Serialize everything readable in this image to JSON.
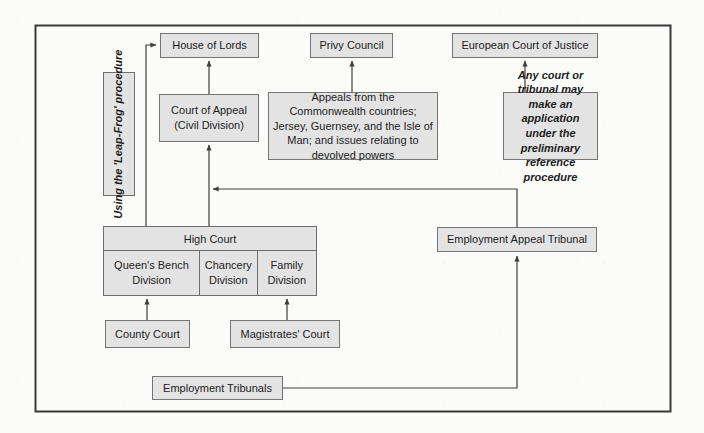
{
  "diagram": {
    "frame": {
      "x": 35,
      "y": 25,
      "width": 636,
      "height": 387,
      "stroke": "#3a3a3a"
    },
    "colors": {
      "box_fill": "#e3e3e3",
      "box_stroke": "#6e6e6e",
      "line": "#3f3f3f",
      "text": "#1d1d1d",
      "page_background": "#fbfbfa"
    },
    "nodes": [
      {
        "id": "house-of-lords",
        "label": "House of Lords",
        "x": 160,
        "y": 33,
        "w": 99,
        "h": 25,
        "style": "plain"
      },
      {
        "id": "privy-council",
        "label": "Privy Council",
        "x": 310,
        "y": 33,
        "w": 83,
        "h": 25,
        "style": "plain"
      },
      {
        "id": "european-court-of-justice",
        "label": "European Court of Justice",
        "x": 452,
        "y": 33,
        "w": 146,
        "h": 25,
        "style": "plain"
      },
      {
        "id": "court-of-appeal",
        "label": "Court of Appeal\n(Civil Division)",
        "x": 159,
        "y": 94,
        "w": 100,
        "h": 48,
        "style": "plain"
      },
      {
        "id": "privy-council-jurisdiction",
        "label": "Appeals from the Commonwealth countries; Jersey, Guernsey, and the Isle of Man; and issues relating to devolved powers",
        "x": 268,
        "y": 92,
        "w": 170,
        "h": 68,
        "style": "plain"
      },
      {
        "id": "ecj-reference-note",
        "label": "Any court or tribunal may make an application under the preliminary reference procedure",
        "x": 503,
        "y": 92,
        "w": 95,
        "h": 68,
        "style": "italic"
      },
      {
        "id": "employment-appeal-tribunal",
        "label": "Employment Appeal Tribunal",
        "x": 437,
        "y": 227,
        "w": 160,
        "h": 25,
        "style": "plain"
      },
      {
        "id": "county-court",
        "label": "County Court",
        "x": 105,
        "y": 320,
        "w": 85,
        "h": 28,
        "style": "plain"
      },
      {
        "id": "magistrates-court",
        "label": "Magistrates' Court",
        "x": 230,
        "y": 320,
        "w": 110,
        "h": 28,
        "style": "plain"
      },
      {
        "id": "employment-tribunals",
        "label": "Employment Tribunals",
        "x": 152,
        "y": 376,
        "w": 131,
        "h": 24,
        "style": "plain"
      }
    ],
    "high_court": {
      "id": "high-court",
      "header_label": "High Court",
      "x": 103,
      "y": 226,
      "w": 214,
      "h": 70,
      "header_h": 24,
      "divisions": [
        {
          "id": "queens-bench-division",
          "label": "Queen's Bench Division",
          "width_px": 97
        },
        {
          "id": "chancery-division",
          "label": "Chancery Division",
          "width_px": 58
        },
        {
          "id": "family-division",
          "label": "Family Division",
          "width_px": 59
        }
      ]
    },
    "leapfrog": {
      "id": "leap-frog-procedure",
      "label": "Using the 'Leap-Frog' procedure",
      "x": 103,
      "y": 72,
      "w": 32,
      "h": 124
    },
    "edges": [
      {
        "id": "edge-court-of-appeal-to-house-of-lords",
        "from": "court-of-appeal",
        "to": "house-of-lords",
        "kind": "straight-up"
      },
      {
        "id": "edge-high-court-to-court-of-appeal",
        "from": "high-court",
        "to": "court-of-appeal",
        "kind": "straight-up"
      },
      {
        "id": "edge-high-court-to-house-of-lords-leapfrog",
        "from": "high-court",
        "to": "house-of-lords",
        "kind": "elbow-left"
      },
      {
        "id": "edge-privy-jurisdiction-to-privy-council",
        "from": "privy-council-jurisdiction",
        "to": "privy-council",
        "kind": "straight-up"
      },
      {
        "id": "edge-ecj-note-to-ecj",
        "from": "ecj-reference-note",
        "to": "european-court-of-justice",
        "kind": "straight-up"
      },
      {
        "id": "edge-county-court-to-queens-bench",
        "from": "county-court",
        "to": "queens-bench-division",
        "kind": "straight-up"
      },
      {
        "id": "edge-magistrates-to-family-division",
        "from": "magistrates-court",
        "to": "family-division",
        "kind": "straight-up"
      },
      {
        "id": "edge-employment-tribunals-to-appeal-tribunal",
        "from": "employment-tribunals",
        "to": "employment-appeal-tribunal",
        "kind": "elbow-right-up"
      },
      {
        "id": "edge-employment-appeal-tribunal-to-court-of-appeal",
        "from": "employment-appeal-tribunal",
        "to": "court-of-appeal",
        "kind": "elbow-left-into-stem"
      }
    ]
  }
}
